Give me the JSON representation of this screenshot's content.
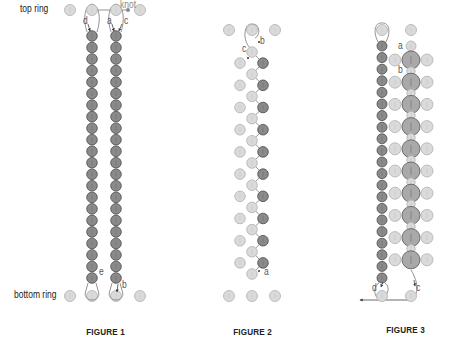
{
  "colors": {
    "dark_bead_fill": "#8a8a8a",
    "dark_bead_stroke": "#4a4a4a",
    "light_bead_fill": "#dadada",
    "light_bead_stroke": "#b0b0b0",
    "big_bead_fill": "#a9a9a9",
    "big_bead_stroke": "#555555",
    "thread": "#777777",
    "arrow": "#444444",
    "knot": "#888888"
  },
  "labels": {
    "top_ring": "top ring",
    "bottom_ring": "bottom ring",
    "knot": "knot"
  },
  "figures": [
    {
      "id": "figure-1",
      "caption": "FIGURE 1",
      "letters": [
        "d",
        "a",
        "c",
        "e",
        "b"
      ]
    },
    {
      "id": "figure-2",
      "caption": "FIGURE 2",
      "letters": [
        "b",
        "c",
        "a"
      ]
    },
    {
      "id": "figure-3",
      "caption": "FIGURE 3",
      "letters": [
        "a",
        "b",
        "d",
        "c"
      ]
    }
  ],
  "layout": {
    "fig1": {
      "top_ring_y": 10,
      "bottom_ring_y": 296,
      "ring_x": [
        70,
        92,
        116,
        140
      ],
      "columns_x": [
        92,
        116
      ],
      "column_start_y": 36,
      "column_end_y": 278,
      "bead_count": 22,
      "knot_x": 128
    },
    "fig2": {
      "top_ring_y": 30,
      "bottom_ring_y": 296,
      "ring_x": [
        229,
        252,
        275
      ],
      "center_x": 252,
      "left_x": 240,
      "right_x": 263,
      "center_start_y": 52,
      "rows": 10,
      "row_spacing": 22.2
    },
    "fig3": {
      "top_ring_y": 30,
      "bottom_ring_y": 296,
      "ring_x": [
        382,
        411
      ],
      "left_col_x": 382,
      "left_start_y": 46,
      "left_end_y": 278,
      "left_count": 21,
      "big_x": 411,
      "big_start_y": 60,
      "big_rows": 10,
      "big_spacing": 22.2,
      "side_offset": 16
    }
  }
}
